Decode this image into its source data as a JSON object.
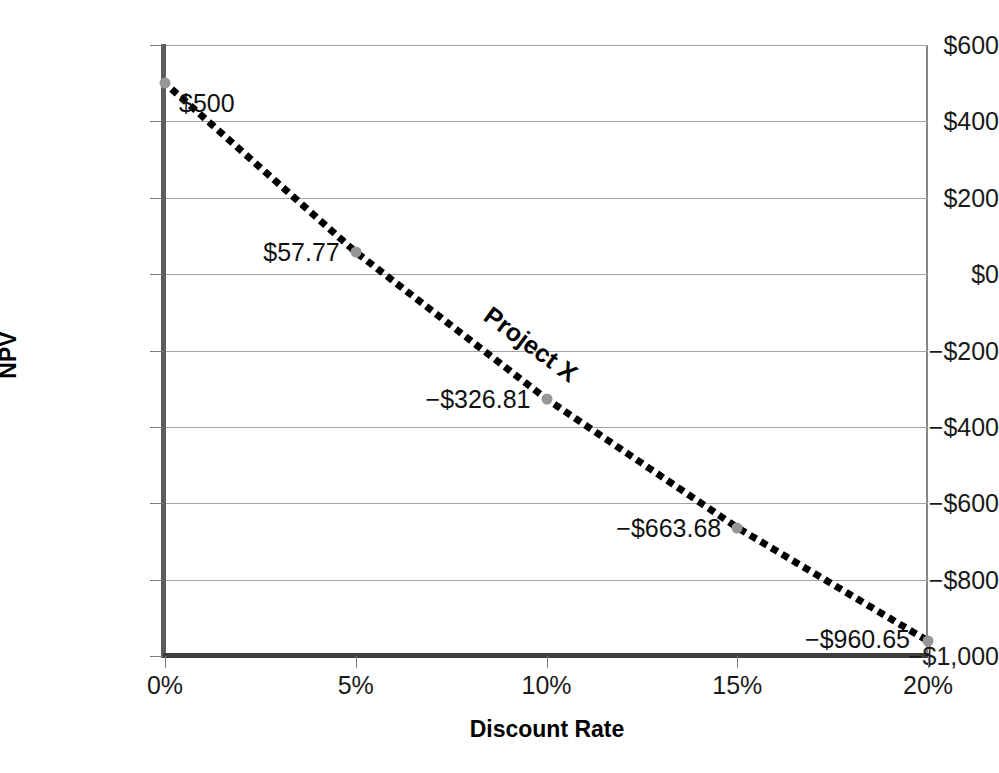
{
  "chart_data": {
    "type": "line",
    "title": "",
    "xlabel": "Discount Rate",
    "ylabel": "NPV",
    "series_label": "Project X",
    "x": [
      0,
      5,
      10,
      15,
      20
    ],
    "values": [
      500,
      57.77,
      -326.81,
      -663.68,
      -960.65
    ],
    "point_labels": [
      "$500",
      "$57.77",
      "−$326.81",
      "−$663.68",
      "−$960.65"
    ],
    "xtick_labels": [
      "0%",
      "5%",
      "10%",
      "15%",
      "20%"
    ],
    "xtick_values": [
      0,
      5,
      10,
      15,
      20
    ],
    "ytick_labels": [
      "$600",
      "$400",
      "$200",
      "$0",
      "−$200",
      "−$400",
      "−$600",
      "−$800",
      "−$1,000"
    ],
    "ytick_values": [
      600,
      400,
      200,
      0,
      -200,
      -400,
      -600,
      -800,
      -1000
    ],
    "xlim": [
      0,
      20
    ],
    "ylim": [
      -1000,
      600
    ],
    "grid": "horizontal",
    "legend": "none",
    "line_style": "dotted",
    "colors": {
      "line": "#000000",
      "marker": "#969696",
      "gridline": "#a3a3a3",
      "axis": "#5c5c5c",
      "text": "#111111",
      "background": "#ffffff"
    }
  }
}
